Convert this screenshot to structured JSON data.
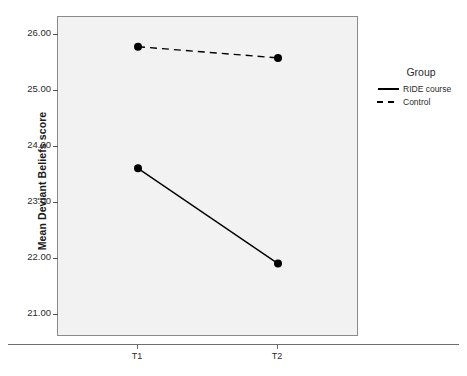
{
  "chart_data": {
    "type": "line",
    "title": "",
    "xlabel": "",
    "ylabel": "Mean Deviant Beliefs score",
    "categories": [
      "T1",
      "T2"
    ],
    "ylim": [
      20.62,
      26.33
    ],
    "yticks": [
      21.0,
      22.0,
      23.0,
      24.0,
      25.0,
      26.0
    ],
    "ytick_labels": [
      "21.00",
      "22.00",
      "23.00",
      "24.00",
      "25.00",
      "26.00"
    ],
    "grid": false,
    "legend_position": "right",
    "legend_title": "Group",
    "series": [
      {
        "name": "RIDE course",
        "style": "solid",
        "marker": "filled-circle",
        "color": "#000000",
        "values": [
          23.63,
          21.93
        ]
      },
      {
        "name": "Control",
        "style": "dashed",
        "marker": "filled-circle",
        "color": "#000000",
        "values": [
          25.8,
          25.6
        ]
      }
    ]
  },
  "axes": {
    "y_title": "Mean Deviant Beliefs score",
    "y_tick_labels": [
      "26.00",
      "25.00",
      "24.00",
      "23.00",
      "22.00",
      "21.00"
    ],
    "x_tick_labels": [
      "T1",
      "T2"
    ]
  },
  "legend": {
    "title": "Group",
    "entries": [
      {
        "label": "RIDE course",
        "style": "solid"
      },
      {
        "label": "Control",
        "style": "dashed"
      }
    ]
  },
  "colors": {
    "plot_background": "#f2f2f2",
    "frame": "#8a8a8a",
    "series": "#000000",
    "text": "#2b2b2b",
    "page_background": "#ffffff"
  }
}
